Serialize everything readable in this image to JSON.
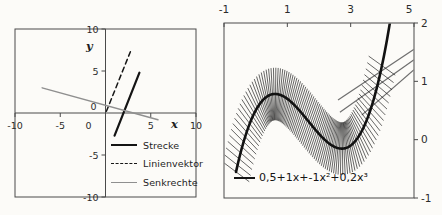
{
  "figure": {
    "background": "#fcfbf8",
    "description_colors": {
      "axis": "#4a4a4a",
      "text": "#2b2b2b",
      "black_line": "#161616",
      "gray_line": "#8f8f8f"
    }
  },
  "chart_data": [
    {
      "type": "line",
      "name": "line-geometry-chart",
      "xlabel": "x",
      "ylabel": "y",
      "xlim": [
        -10,
        10
      ],
      "ylim": [
        -10,
        10
      ],
      "x_ticks": [
        -10,
        -5,
        0,
        5,
        10
      ],
      "y_ticks": [
        10,
        5,
        0,
        -5,
        -10
      ],
      "grid": false,
      "legend_position": "inside-bottom-right",
      "series": [
        {
          "name": "Strecke",
          "dash": "solid",
          "color": "#141414",
          "width": 2.2,
          "points": [
            [
              1.0,
              -2.7
            ],
            [
              3.75,
              4.8
            ]
          ]
        },
        {
          "name": "Linienvektor",
          "dash": "dashed",
          "color": "#161616",
          "width": 1.5,
          "points": [
            [
              0.1,
              0.2
            ],
            [
              2.75,
              7.3
            ]
          ]
        },
        {
          "name": "Senkrechte",
          "dash": "solid",
          "color": "#8f8f8f",
          "width": 1.4,
          "points": [
            [
              -7.0,
              3.0
            ],
            [
              5.8,
              -0.8
            ]
          ]
        }
      ]
    },
    {
      "type": "line",
      "name": "cubic-function-normals-chart",
      "formula_label": "0,5+1x+-1x²+0,2x³",
      "coefficients": {
        "c0": 0.5,
        "c1": 1,
        "c2": -1,
        "c3": 0.2
      },
      "xlim": [
        -1,
        5
      ],
      "ylim": [
        -1,
        2
      ],
      "x_ticks": [
        -1,
        1,
        3,
        5
      ],
      "y_ticks": [
        2,
        1,
        0,
        -1
      ],
      "x_axis_position": "top",
      "y_axis_position": "right",
      "grid": false,
      "curve_range": [
        -0.62,
        4.3
      ],
      "normals": {
        "range": [
          -0.62,
          4.0
        ],
        "step": 0.048,
        "half_length": 0.45
      },
      "tangent_segments": [
        {
          "from": [
            2.6,
            0.68
          ],
          "to": [
            5.0,
            1.55
          ]
        },
        {
          "from": [
            2.66,
            0.47
          ],
          "to": [
            5.0,
            1.37
          ]
        },
        {
          "from": [
            3.35,
            0.42
          ],
          "to": [
            5.0,
            1.2
          ]
        }
      ],
      "colors": {
        "curve": "#121212",
        "normals": "#1b1b1b",
        "tangents": "#6e6e6e"
      },
      "legend_position": "inside-bottom-left"
    }
  ]
}
